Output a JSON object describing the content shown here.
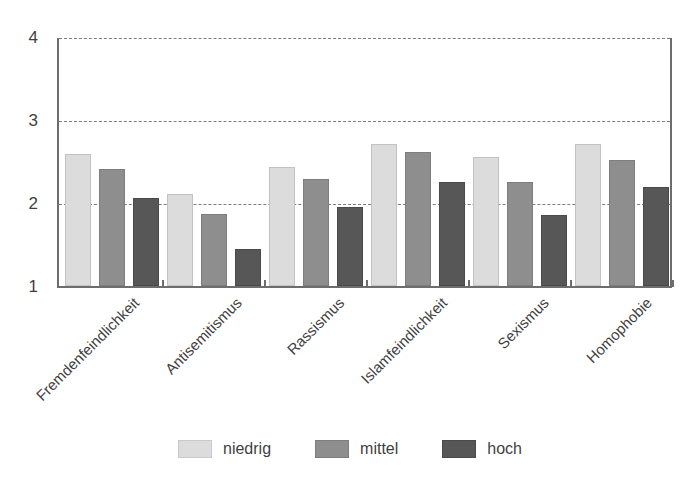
{
  "chart_data": {
    "type": "bar",
    "title": "",
    "subtitle": "",
    "xlabel": "",
    "ylabel": "",
    "ylim": [
      1,
      4
    ],
    "yticks": [
      "1",
      "2",
      "3",
      "4"
    ],
    "grid": "horizontal-dashed",
    "legend_position": "bottom-center",
    "categories": [
      "Fremdenfeindlichkeit",
      "Antisemitismus",
      "Rassismus",
      "Islamfeindlichkeit",
      "Sexismus",
      "Homophobie"
    ],
    "series": [
      {
        "name": "niedrig",
        "color": "#dcdcdc",
        "values": [
          2.58,
          2.1,
          2.43,
          2.71,
          2.55,
          2.71
        ]
      },
      {
        "name": "mittel",
        "color": "#8e8e8e",
        "values": [
          2.4,
          1.86,
          2.29,
          2.61,
          2.25,
          2.51
        ]
      },
      {
        "name": "hoch",
        "color": "#575757",
        "values": [
          2.06,
          1.44,
          1.95,
          2.25,
          1.85,
          2.19
        ]
      }
    ]
  },
  "axis": {
    "y_ticks": [
      {
        "label": "4"
      },
      {
        "label": "3"
      },
      {
        "label": "2"
      },
      {
        "label": "1"
      }
    ]
  },
  "legend": {
    "items": [
      {
        "label": "niedrig"
      },
      {
        "label": "mittel"
      },
      {
        "label": "hoch"
      }
    ]
  }
}
